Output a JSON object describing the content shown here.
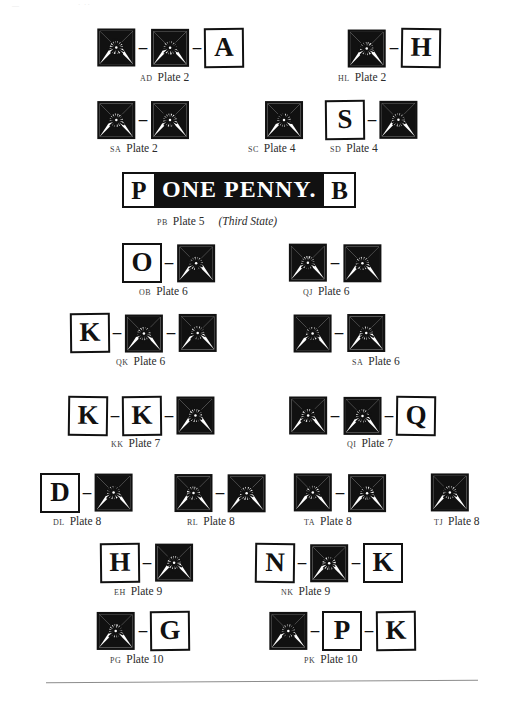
{
  "page": {
    "artifact_top_left": "—",
    "artifact_top_mid": "· ··"
  },
  "banner": {
    "left_letter": "P",
    "text": "ONE PENNY.",
    "right_letter": "B",
    "caption_code": "PB",
    "caption_plate": "Plate 5",
    "caption_state": "(Third State)"
  },
  "rows": [
    {
      "groups": [
        {
          "code": "AD",
          "plate": "Plate 2",
          "items": [
            "motif",
            "dash",
            "motif",
            "dash",
            "letter:A"
          ]
        },
        {
          "code": "HL",
          "plate": "Plate 2",
          "items": [
            "motif",
            "dash",
            "letter:H"
          ]
        }
      ]
    },
    {
      "groups": [
        {
          "code": "SA",
          "plate": "Plate 2",
          "items": [
            "motif",
            "dash",
            "motif"
          ]
        },
        {
          "code": "SC",
          "plate": "Plate 4",
          "items": [
            "motif"
          ]
        },
        {
          "code": "SD",
          "plate": "Plate 4",
          "items": [
            "letter:S",
            "dash",
            "motif"
          ]
        }
      ]
    },
    {
      "groups": [
        {
          "code": "OB",
          "plate": "Plate 6",
          "items": [
            "letter:O",
            "dash",
            "motif"
          ]
        },
        {
          "code": "QJ",
          "plate": "Plate 6",
          "items": [
            "motif",
            "dash",
            "motif"
          ]
        }
      ]
    },
    {
      "groups": [
        {
          "code": "QK",
          "plate": "Plate 6",
          "items": [
            "letter:K",
            "dash",
            "motif",
            "dash",
            "motif"
          ]
        },
        {
          "code": "SA",
          "plate": "Plate 6",
          "items": [
            "motif",
            "dash",
            "motif"
          ]
        }
      ]
    },
    {
      "groups": [
        {
          "code": "KK",
          "plate": "Plate 7",
          "items": [
            "letter:K",
            "dash",
            "letter:K",
            "dash",
            "motif"
          ]
        },
        {
          "code": "QI",
          "plate": "Plate 7",
          "items": [
            "motif",
            "dash",
            "motif",
            "dash",
            "letter:Q"
          ]
        }
      ]
    },
    {
      "groups": [
        {
          "code": "DL",
          "plate": "Plate 8",
          "items": [
            "letter:D",
            "dash",
            "motif"
          ]
        },
        {
          "code": "RL",
          "plate": "Plate 8",
          "items": [
            "motif",
            "dash",
            "motif"
          ]
        },
        {
          "code": "TA",
          "plate": "Plate 8",
          "items": [
            "motif",
            "dash",
            "motif"
          ]
        },
        {
          "code": "TJ",
          "plate": "Plate 8",
          "items": [
            "motif"
          ]
        }
      ]
    },
    {
      "groups": [
        {
          "code": "EH",
          "plate": "Plate 9",
          "items": [
            "letter:H",
            "dash",
            "motif"
          ]
        },
        {
          "code": "NK",
          "plate": "Plate 9",
          "items": [
            "letter:N",
            "dash",
            "motif",
            "dash",
            "letter:K"
          ]
        }
      ]
    },
    {
      "groups": [
        {
          "code": "PG",
          "plate": "Plate 10",
          "items": [
            "motif",
            "dash",
            "letter:G"
          ]
        },
        {
          "code": "PK",
          "plate": "Plate 10",
          "items": [
            "motif",
            "dash",
            "letter:P",
            "dash",
            "letter:K"
          ]
        }
      ]
    }
  ],
  "dash_glyph": "–",
  "letters": {
    "A": "A",
    "B": "B",
    "D": "D",
    "G": "G",
    "H": "H",
    "K": "K",
    "N": "N",
    "O": "O",
    "P": "P",
    "Q": "Q",
    "S": "S"
  },
  "colors": {
    "ink": "#111111",
    "paper": "#ffffff",
    "caption": "#2b2b2b",
    "rule": "#8c8c8c"
  }
}
